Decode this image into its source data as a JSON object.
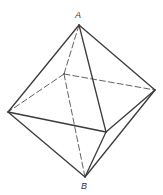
{
  "diagram": {
    "type": "octahedron",
    "stroke_color": "#3a3a3a",
    "background": "#ffffff",
    "vertices": {
      "A": [
        79,
        25
      ],
      "B": [
        85,
        177
      ],
      "L": [
        8,
        112
      ],
      "R": [
        155,
        90
      ],
      "K": [
        64,
        74
      ],
      "F": [
        106,
        132
      ]
    },
    "labels": [
      {
        "id": "A",
        "text": "A",
        "x": 75,
        "y": 11
      },
      {
        "id": "B",
        "text": "B",
        "x": 81,
        "y": 182
      }
    ],
    "solid_edges": [
      [
        "A",
        "L"
      ],
      [
        "A",
        "R"
      ],
      [
        "A",
        "F"
      ],
      [
        "L",
        "F"
      ],
      [
        "F",
        "R"
      ],
      [
        "L",
        "B"
      ],
      [
        "F",
        "B"
      ],
      [
        "R",
        "B"
      ]
    ],
    "dashed_edges": [
      [
        "A",
        "K"
      ],
      [
        "K",
        "L"
      ],
      [
        "K",
        "R"
      ],
      [
        "K",
        "B"
      ]
    ]
  }
}
